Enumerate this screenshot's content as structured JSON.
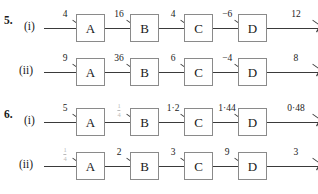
{
  "page": {
    "background_color": "#ffffff",
    "ink_color": "#1a1a1a",
    "box_border_color": "#8a8a8a",
    "arrow_color": "#3a3a3a",
    "faint_ink_color": "#b9b9b9"
  },
  "problems": [
    {
      "number": "5.",
      "rows": [
        {
          "part": "(i)",
          "machines": [
            "A",
            "B",
            "C",
            "D"
          ],
          "labels": [
            "4",
            "16",
            "4",
            "−6",
            "12"
          ]
        },
        {
          "part": "(ii)",
          "machines": [
            "A",
            "B",
            "C",
            "D"
          ],
          "labels": [
            "9",
            "36",
            "6",
            "−4",
            "8"
          ]
        }
      ]
    },
    {
      "number": "6.",
      "rows": [
        {
          "part": "(i)",
          "machines": [
            "A",
            "B",
            "C",
            "D"
          ],
          "labels": [
            "5",
            "",
            "1·2",
            "1·44",
            "0·48"
          ],
          "fraction_labels": {
            "1": {
              "numerator": "1",
              "denominator": "4",
              "faint": true
            }
          }
        },
        {
          "part": "(ii)",
          "machines": [
            "A",
            "B",
            "C",
            "D"
          ],
          "labels": [
            "",
            "2",
            "3",
            "9",
            "3"
          ],
          "fraction_labels": {
            "0": {
              "numerator": "1",
              "denominator": "4",
              "faint": true
            }
          }
        }
      ]
    }
  ],
  "layout": {
    "segment_lefts": [
      0,
      54,
      108,
      162,
      216
    ],
    "segment_widths": [
      34,
      34,
      34,
      34,
      58
    ],
    "box_lefts": [
      32,
      86,
      140,
      194
    ]
  }
}
